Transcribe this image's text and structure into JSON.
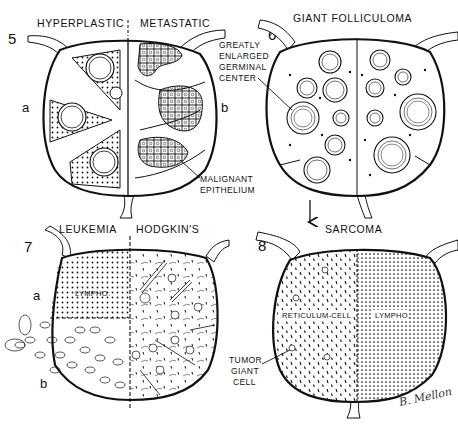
{
  "figure": {
    "panels": [
      {
        "number": "5",
        "labels": [
          "HYPERPLASTIC",
          "METASTATIC"
        ],
        "side_labels": [
          "a",
          "b"
        ],
        "callout": "MALIGNANT EPITHELIUM",
        "callout_lines": [
          "MALIGNANT",
          "EPITHELIUM"
        ]
      },
      {
        "number": "6",
        "title": "GIANT FOLLICULOMA",
        "callout": "GREATLY ENLARGED GERMINAL CENTER",
        "callout_lines": [
          "GREATLY",
          "ENLARGED",
          "GERMINAL",
          "CENTER"
        ]
      },
      {
        "number": "7",
        "labels": [
          "LEUKEMIA",
          "HODGKIN'S"
        ],
        "side_labels": [
          "a",
          "b"
        ],
        "inner_label": "LYMPHO."
      },
      {
        "number": "8",
        "title": "SARCOMA",
        "inner_labels": [
          "RETICULUM-CELL",
          "LYMPHO."
        ],
        "callout": "TUMOR GIANT CELL",
        "callout_lines": [
          "TUMOR",
          "GIANT",
          "CELL"
        ]
      }
    ],
    "arrow": "down-arrow",
    "signature": "B. Mellon",
    "colors": {
      "ink": "#111111",
      "background": "#ffffff"
    }
  }
}
